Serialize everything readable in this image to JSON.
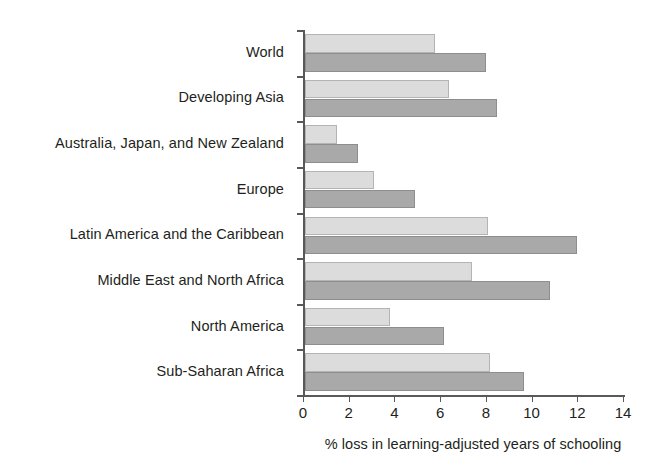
{
  "chart_data": {
    "type": "bar",
    "orientation": "horizontal",
    "title": "",
    "subtitle": "",
    "xlabel": "% loss in learning-adjusted years of schooling",
    "ylabel": "",
    "xlim": [
      0,
      14
    ],
    "xticks": [
      0,
      2,
      4,
      6,
      8,
      10,
      12,
      14
    ],
    "xtick_labels": [
      "0",
      "2",
      "4",
      "6",
      "8",
      "10",
      "12",
      "14"
    ],
    "grid": false,
    "legend": false,
    "legend_position": "none",
    "categories": [
      "World",
      "Developing Asia",
      "Australia, Japan, and New Zealand",
      "Europe",
      "Latin America and the Caribbean",
      "Middle East and North Africa",
      "North America",
      "Sub-Saharan Africa"
    ],
    "series": [
      {
        "name": "series-1",
        "color": "#dcdcdc",
        "values": [
          5.7,
          6.3,
          1.4,
          3.0,
          8.0,
          7.3,
          3.7,
          8.1
        ]
      },
      {
        "name": "series-2",
        "color": "#a9a9a9",
        "values": [
          7.9,
          8.4,
          2.3,
          4.8,
          11.9,
          10.7,
          6.1,
          9.6
        ]
      }
    ]
  },
  "colors": {
    "axis": "#58595b",
    "text": "#231f20",
    "background": "#ffffff",
    "series_light": "#dcdcdc",
    "series_dark": "#a9a9a9"
  }
}
